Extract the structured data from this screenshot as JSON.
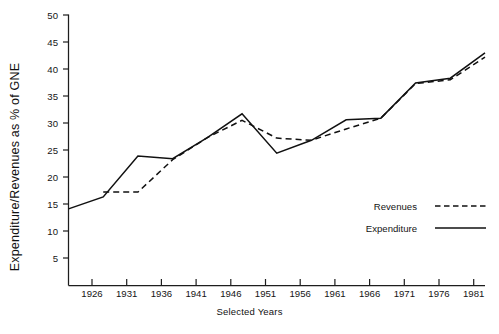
{
  "chart_data": {
    "type": "line",
    "title": "",
    "xlabel": "Selected Years",
    "ylabel": "Expenditure/Revenues as % of GNE",
    "categories": [
      "1921",
      "1926",
      "1931",
      "1936",
      "1941",
      "1946",
      "1951",
      "1956",
      "1961",
      "1966",
      "1971",
      "1976",
      "1981"
    ],
    "xtick_labels": [
      "1926",
      "1931",
      "1936",
      "1941",
      "1946",
      "1951",
      "1956",
      "1961",
      "1966",
      "1971",
      "1976",
      "1981"
    ],
    "ytick_labels": [
      "5",
      "10",
      "15",
      "20",
      "25",
      "30",
      "35",
      "40",
      "45",
      "50"
    ],
    "ylim": [
      0,
      50
    ],
    "xlim": [
      "1921",
      "1983"
    ],
    "grid": false,
    "legend_position": "inside-right-lower",
    "series": [
      {
        "name": "Expenditure",
        "style": "solid",
        "values": [
          14.1,
          16.3,
          23.9,
          23.4,
          27.3,
          31.7,
          24.4,
          26.8,
          30.6,
          30.9,
          37.4,
          38.3,
          43.0
        ]
      },
      {
        "name": "Revenues",
        "style": "dashed",
        "values": [
          null,
          17.2,
          17.2,
          23.2,
          27.3,
          30.5,
          27.2,
          26.8,
          28.9,
          30.9,
          37.3,
          38.0,
          42.2
        ]
      }
    ]
  },
  "legend": {
    "entries": [
      {
        "label": "Revenues",
        "style": "dashed"
      },
      {
        "label": "Expenditure",
        "style": "solid"
      }
    ]
  },
  "axes": {
    "y_title": "Expenditure/Revenues as % of GNE",
    "x_title": "Selected Years"
  }
}
